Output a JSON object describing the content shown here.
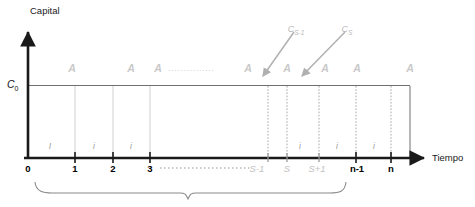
{
  "diagram": {
    "title_y_axis": "Capital",
    "title_x_axis": "Tiempo",
    "initial_capital_label": "C",
    "initial_capital_sub": "0",
    "annuity_symbol": "A",
    "interest_symbol": "i",
    "leader_dots_top": "...............",
    "leader_dots_bottom": "......................"
  },
  "annuities": [
    {
      "label": "A",
      "x": 72
    },
    {
      "label": "A",
      "x": 131
    },
    {
      "label": "A",
      "x": 158
    },
    {
      "label": "A",
      "x": 248
    },
    {
      "label": "A",
      "x": 287
    },
    {
      "label": "A",
      "x": 325
    },
    {
      "label": "A",
      "x": 357
    },
    {
      "label": "A",
      "x": 410
    }
  ],
  "interest_marks": [
    {
      "label": "I",
      "x": 50
    },
    {
      "label": "i",
      "x": 94
    },
    {
      "label": "i",
      "x": 131
    },
    {
      "label": "i",
      "x": 300
    },
    {
      "label": "i",
      "x": 337
    },
    {
      "label": "i",
      "x": 374
    }
  ],
  "ticks": [
    {
      "label": "0",
      "x": 28,
      "style": "dark"
    },
    {
      "label": "1",
      "x": 75,
      "style": "dark"
    },
    {
      "label": "2",
      "x": 113,
      "style": "dark"
    },
    {
      "label": "3",
      "x": 150,
      "style": "dark"
    },
    {
      "label": "S-1",
      "x": 257,
      "style": "gray"
    },
    {
      "label": "S",
      "x": 287,
      "style": "gray"
    },
    {
      "label": "S+1",
      "x": 317,
      "style": "gray"
    },
    {
      "label": "n-1",
      "x": 357,
      "style": "dark"
    },
    {
      "label": "n",
      "x": 391,
      "style": "dark"
    }
  ],
  "callouts": [
    {
      "label": "C",
      "sub": "S-1",
      "x": 296,
      "y": 25
    },
    {
      "label": "C",
      "sub": "S",
      "x": 347,
      "y": 25
    }
  ],
  "colors": {
    "axis": "#1a1a1a",
    "gray_text": "#c9c9c9",
    "grid": "#cfcfcf",
    "brace": "#8a8a8a",
    "arrow": "#b0b0b0"
  }
}
